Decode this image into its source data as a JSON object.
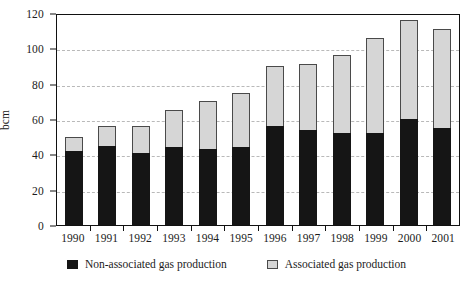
{
  "chart_data": {
    "type": "bar",
    "title": "",
    "subtitle": "",
    "xlabel": "",
    "ylabel": "bcm",
    "ylim": [
      0,
      120
    ],
    "yticks": [
      0,
      20,
      40,
      60,
      80,
      100,
      120
    ],
    "grid": true,
    "stacked": true,
    "legend_position": "bottom",
    "categories": [
      "1990",
      "1991",
      "1992",
      "1993",
      "1994",
      "1995",
      "1996",
      "1997",
      "1998",
      "1999",
      "2000",
      "2001"
    ],
    "series": [
      {
        "name": "Non-associated gas production",
        "color": "#151515",
        "values": [
          42,
          45,
          41,
          44,
          43,
          44,
          56,
          54,
          52,
          52,
          60,
          55
        ]
      },
      {
        "name": "Associated gas production",
        "color": "#d6d6d6",
        "values": [
          8,
          11,
          15,
          21,
          27,
          31,
          34,
          37,
          44,
          54,
          56,
          56
        ]
      }
    ],
    "totals": [
      50,
      56,
      56,
      65,
      70,
      75,
      90,
      91,
      96,
      106,
      116,
      111
    ]
  },
  "legend": {
    "items": [
      {
        "label": "Non-associated gas production",
        "swatch": "black-square-swatch"
      },
      {
        "label": "Associated gas production",
        "swatch": "grey-square-swatch"
      }
    ]
  },
  "axes": {
    "y_title": "bcm",
    "y_tick_labels": [
      "120",
      "100",
      "80",
      "60",
      "40",
      "20",
      "0"
    ],
    "x_tick_labels": [
      "1990",
      "1991",
      "1992",
      "1993",
      "1994",
      "1995",
      "1996",
      "1997",
      "1998",
      "1999",
      "2000",
      "2001"
    ]
  },
  "footer": {
    "source_note": ""
  }
}
